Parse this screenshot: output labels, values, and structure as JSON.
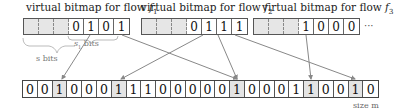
{
  "diagram": {
    "virtual_bitmaps": [
      {
        "title_prefix": "virtual bitmap for flow ",
        "flow_symbol": "f",
        "flow_index": "1",
        "cells": [
          "",
          "",
          "",
          "0",
          "1",
          "0",
          "1"
        ],
        "dotted": [
          true,
          true,
          true,
          false,
          false,
          false,
          false
        ]
      },
      {
        "title_prefix": "virtual bitmap for flow ",
        "flow_symbol": "f",
        "flow_index": "2",
        "cells": [
          "",
          "",
          "",
          "0",
          "1",
          "1",
          "1"
        ],
        "dotted": [
          true,
          true,
          true,
          false,
          false,
          false,
          false
        ]
      },
      {
        "title_prefix": "virtual bitmap for flow ",
        "flow_symbol": "f",
        "flow_index": "3",
        "cells": [
          "",
          "",
          "",
          "1",
          "0",
          "0",
          "0"
        ],
        "dotted": [
          true,
          true,
          true,
          false,
          false,
          false,
          false
        ]
      }
    ],
    "ellipsis": "···",
    "physical_bitmap": {
      "cells": [
        "0",
        "0",
        "1",
        "0",
        "0",
        "0",
        "1",
        "1",
        "1",
        "0",
        "0",
        "0",
        "0",
        "0",
        "1",
        "0",
        "0",
        "0",
        "1",
        "1",
        "0",
        "0",
        "1",
        "0"
      ],
      "shaded_indices": [
        2,
        6,
        14,
        19,
        22
      ],
      "size_label": "size m"
    },
    "brace_labels": {
      "s_bits": "s bits",
      "s1_bits_symbol": "s",
      "s1_bits_index": "1",
      "s1_bits_suffix": " bits"
    },
    "mappings": [
      {
        "from_flow": 1,
        "from_cell": 4,
        "to_cell": 2
      },
      {
        "from_flow": 1,
        "from_cell": 6,
        "to_cell": 14
      },
      {
        "from_flow": 2,
        "from_cell": 4,
        "to_cell": 6
      },
      {
        "from_flow": 2,
        "from_cell": 5,
        "to_cell": 14
      },
      {
        "from_flow": 2,
        "from_cell": 6,
        "to_cell": 22
      },
      {
        "from_flow": 3,
        "from_cell": 3,
        "to_cell": 19
      }
    ],
    "colors": {
      "arrow": "#888888",
      "brace": "#999999",
      "shade": "#e4e4e4"
    }
  }
}
